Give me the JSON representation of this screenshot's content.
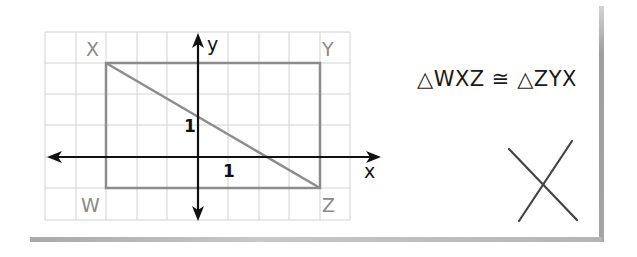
{
  "diagram": {
    "grid": {
      "cols": 10,
      "rows": 6,
      "x_range": [
        -5,
        5
      ],
      "y_range": [
        -2,
        4
      ]
    },
    "axes": {
      "x_label": "x",
      "y_label": "y",
      "x_tick_label": "1",
      "y_tick_label": "1"
    },
    "points": [
      {
        "name": "X",
        "coords": [
          -3,
          3
        ]
      },
      {
        "name": "Y",
        "coords": [
          4,
          3
        ]
      },
      {
        "name": "W",
        "coords": [
          -3,
          -1
        ]
      },
      {
        "name": "Z",
        "coords": [
          4,
          -1
        ]
      }
    ],
    "segments": [
      {
        "from": "W",
        "to": "X"
      },
      {
        "from": "X",
        "to": "Y"
      },
      {
        "from": "Y",
        "to": "Z"
      },
      {
        "from": "Z",
        "to": "W"
      },
      {
        "from": "X",
        "to": "Z"
      }
    ],
    "labels": {
      "X": "X",
      "Y": "Y",
      "W": "W",
      "Z": "Z"
    },
    "statement": "△WXZ ≅ △ZYX",
    "marker": "X-shaped cross",
    "colors": {
      "grid": "#d2d2d2",
      "shape": "#8c8c8c",
      "axes": "#111111",
      "point_labels": "#8a8a8a"
    }
  }
}
